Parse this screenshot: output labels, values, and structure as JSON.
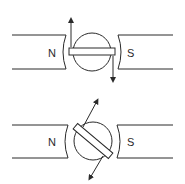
{
  "diagram": {
    "figures": [
      {
        "id": "aligned",
        "north_label": "N",
        "south_label": "S",
        "rotor_angle_deg": 0,
        "description": "Bar magnet rotor aligned horizontally between N and S poles; arrows indicate torque direction (up on left end, down on right end)"
      },
      {
        "id": "rotated",
        "north_label": "N",
        "south_label": "S",
        "rotor_angle_deg": 35,
        "description": "Bar magnet rotor rotated diagonally between N and S poles; arrows indicate direction along rotated axis"
      }
    ],
    "colors": {
      "line": "#2a2a2a",
      "background": "#ffffff"
    }
  }
}
